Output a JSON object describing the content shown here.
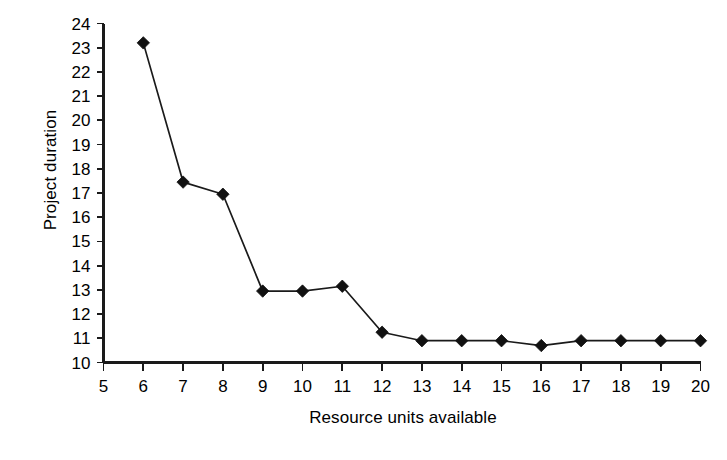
{
  "chart_data": {
    "type": "line",
    "title": "",
    "subtitle": "",
    "xlabel": "Resource units available",
    "ylabel": "Project duration",
    "xlim": [
      5,
      20
    ],
    "ylim": [
      10,
      24
    ],
    "x_ticks": [
      5,
      6,
      7,
      8,
      9,
      10,
      11,
      12,
      13,
      14,
      15,
      16,
      17,
      18,
      19,
      20
    ],
    "y_ticks": [
      10,
      11,
      12,
      13,
      14,
      15,
      16,
      17,
      18,
      19,
      20,
      21,
      22,
      23,
      24
    ],
    "x_tick_labels": [
      "5",
      "6",
      "7",
      "8",
      "9",
      "10",
      "11",
      "12",
      "13",
      "14",
      "15",
      "16",
      "17",
      "18",
      "19",
      "20"
    ],
    "y_tick_labels": [
      "10",
      "11",
      "12",
      "13",
      "14",
      "15",
      "16",
      "17",
      "18",
      "19",
      "20",
      "21",
      "22",
      "23",
      "24"
    ],
    "grid": false,
    "legend": false,
    "legend_position": "none",
    "marker": "diamond",
    "series_color": "#1a1a1a",
    "background_color": "#ffffff",
    "x": [
      6,
      7,
      8,
      9,
      10,
      11,
      12,
      13,
      14,
      15,
      16,
      17,
      18,
      19,
      20
    ],
    "values": [
      23.2,
      17.45,
      16.95,
      12.95,
      12.95,
      13.15,
      11.25,
      10.9,
      10.9,
      10.9,
      10.7,
      10.9,
      10.9,
      10.9,
      10.9
    ],
    "points": [
      {
        "x": 6,
        "y": 23.2
      },
      {
        "x": 7,
        "y": 17.45
      },
      {
        "x": 8,
        "y": 16.95
      },
      {
        "x": 9,
        "y": 12.95
      },
      {
        "x": 10,
        "y": 12.95
      },
      {
        "x": 11,
        "y": 13.15
      },
      {
        "x": 12,
        "y": 11.25
      },
      {
        "x": 13,
        "y": 10.9
      },
      {
        "x": 14,
        "y": 10.9
      },
      {
        "x": 15,
        "y": 10.9
      },
      {
        "x": 16,
        "y": 10.7
      },
      {
        "x": 17,
        "y": 10.9
      },
      {
        "x": 18,
        "y": 10.9
      },
      {
        "x": 19,
        "y": 10.9
      },
      {
        "x": 20,
        "y": 10.9
      }
    ]
  }
}
